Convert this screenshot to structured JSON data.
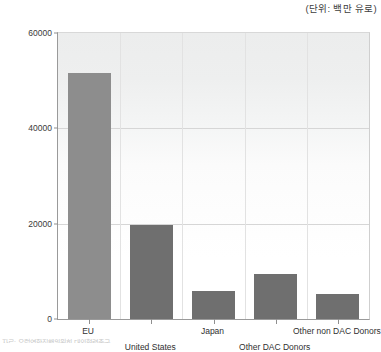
{
  "unit_note": "(단위: 백만 유로)",
  "source_note": "자료: 유럽연합집행위원회 대외협력총국",
  "colors": {
    "bar_primary": "#8d8d8d",
    "bar_secondary": "#6f6f6f",
    "axis": "#9a9a9a",
    "gridline": "#d6d6d6",
    "plot_background": "#ffffff"
  },
  "chart_data": {
    "type": "bar",
    "title": "",
    "subtitle": "",
    "xlabel": "",
    "ylabel": "",
    "unit": "백만 유로",
    "categories": [
      "EU",
      "United States",
      "Japan",
      "Other DAC Donors",
      "Other non DAC Donors"
    ],
    "values": [
      51600,
      19800,
      5900,
      9450,
      5270
    ],
    "ylim": [
      0,
      60000
    ],
    "yticks": [
      0,
      20000,
      40000,
      60000
    ],
    "ytick_labels": [
      "0",
      "20000",
      "40000",
      "60000"
    ],
    "grid": "horizontal-and-faint-vertical",
    "legend": "none",
    "bar_colors": [
      "#8d8d8d",
      "#6f6f6f",
      "#6f6f6f",
      "#6f6f6f",
      "#6f6f6f"
    ],
    "label_rows": [
      0,
      1,
      0,
      1,
      0
    ]
  }
}
